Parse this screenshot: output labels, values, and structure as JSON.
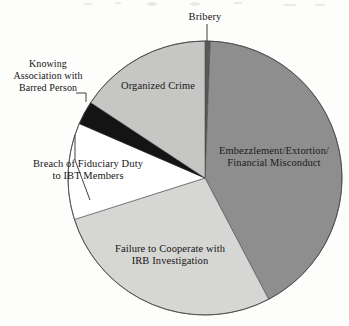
{
  "figure": {
    "kind": "pie-chart-figure",
    "background_color": "#fdfdfc"
  },
  "chart_data": {
    "type": "pie",
    "title": "",
    "subtitle": "",
    "xlabel": "",
    "ylabel": "",
    "grid": false,
    "legend_position": "none",
    "label_placement": "slice-labels-with-leader-lines",
    "start_angle_deg": 0,
    "direction": "clockwise",
    "categories": [
      "Bribery",
      "Embezzlement/Extortion/Financial Misconduct",
      "Failure to Cooperate with IRB Investigation",
      "Breach of Fiduciary Duty to IBT Members",
      "Knowing Association with Barred Person",
      "Organized Crime"
    ],
    "values": [
      0.6,
      41.7,
      27.8,
      11.4,
      2.8,
      15.7
    ],
    "slices": [
      {
        "label": "Bribery",
        "label_lines": [
          "Bribery"
        ],
        "value": 0.6,
        "color": "#595959",
        "start_angle_deg": 0.0,
        "end_angle_deg": 2.2,
        "label_position": "outside-top",
        "leader_line": true
      },
      {
        "label": "Embezzlement/Extortion/Financial Misconduct",
        "label_lines": [
          "Embezzlement/Extortion/",
          "Financial Misconduct"
        ],
        "value": 41.7,
        "color": "#8e8e8e",
        "start_angle_deg": 2.2,
        "end_angle_deg": 152.3,
        "label_position": "inside",
        "leader_line": false
      },
      {
        "label": "Failure to Cooperate with IRB Investigation",
        "label_lines": [
          "Failure to Cooperate with",
          "IRB Investigation"
        ],
        "value": 27.8,
        "color": "#d6d6d4",
        "start_angle_deg": 152.3,
        "end_angle_deg": 252.4,
        "label_position": "inside",
        "leader_line": false
      },
      {
        "label": "Breach of Fiduciary Duty to IBT Members",
        "label_lines": [
          "Breach of Fiduciary Duty",
          "to IBT Members"
        ],
        "value": 11.4,
        "color": "#ffffff",
        "start_angle_deg": 252.4,
        "end_angle_deg": 293.4,
        "label_position": "outside-left",
        "leader_line": true
      },
      {
        "label": "Knowing Association with Barred Person",
        "label_lines": [
          "Knowing",
          "Association with",
          "Barred Person"
        ],
        "value": 2.8,
        "color": "#141414",
        "start_angle_deg": 293.4,
        "end_angle_deg": 303.4,
        "label_position": "outside-left",
        "leader_line": true
      },
      {
        "label": "Organized Crime",
        "label_lines": [
          "Organized Crime"
        ],
        "value": 15.7,
        "color": "#c6c6c4",
        "start_angle_deg": 303.4,
        "end_angle_deg": 360.0,
        "label_position": "inside",
        "leader_line": false
      }
    ],
    "geometry": {
      "center_x": 205,
      "center_y": 178,
      "radius": 137,
      "outline_color": "#4a4a4a"
    }
  },
  "labels": {
    "bribery": "Bribery",
    "knowing_line1": "Knowing",
    "knowing_line2": "Association with",
    "knowing_line3": "Barred Person",
    "organized_crime": "Organized Crime",
    "breach_line1": "Breach of Fiduciary Duty",
    "breach_line2": "to IBT Members",
    "embezzlement_line1": "Embezzlement/Extortion/",
    "embezzlement_line2": "Financial Misconduct",
    "failure_line1": "Failure to Cooperate with",
    "failure_line2": "IRB Investigation"
  }
}
